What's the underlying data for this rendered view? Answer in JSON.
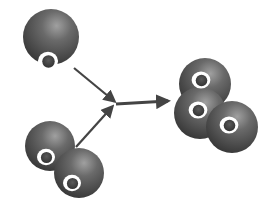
{
  "diagram": {
    "colors": {
      "background": "#ffffff",
      "sphere_dark": "#3a3a3a",
      "sphere_mid": "#6a6a6a",
      "sphere_highlight": "#9a9a9a",
      "ring": "#ffffff",
      "hole": "#4a4a4a",
      "arrow": "#444444"
    },
    "reactants": [
      {
        "name": "single-atom",
        "atoms": [
          {
            "cx": 51,
            "cy": 37,
            "r": 28,
            "hx": 48,
            "hy": 61
          }
        ]
      },
      {
        "name": "diatomic-molecule",
        "atoms": [
          {
            "cx": 50,
            "cy": 146,
            "r": 25,
            "hx": 46,
            "hy": 157
          },
          {
            "cx": 79,
            "cy": 173,
            "r": 25,
            "hx": 72,
            "hy": 183
          }
        ]
      }
    ],
    "product": {
      "name": "triatomic-molecule",
      "atoms": [
        {
          "cx": 205,
          "cy": 84,
          "r": 26,
          "hx": 201,
          "hy": 80
        },
        {
          "cx": 200,
          "cy": 113,
          "r": 26,
          "hx": 198,
          "hy": 110
        },
        {
          "cx": 232,
          "cy": 127,
          "r": 26,
          "hx": 229,
          "hy": 125
        }
      ]
    },
    "arrows": [
      {
        "name": "arrow-from-single",
        "x1": 74,
        "y1": 68,
        "x2": 114,
        "y2": 101
      },
      {
        "name": "arrow-from-diatomic",
        "x1": 76,
        "y1": 147,
        "x2": 112,
        "y2": 107
      },
      {
        "name": "arrow-to-product",
        "x1": 116,
        "y1": 104,
        "x2": 168,
        "y2": 101
      }
    ]
  }
}
